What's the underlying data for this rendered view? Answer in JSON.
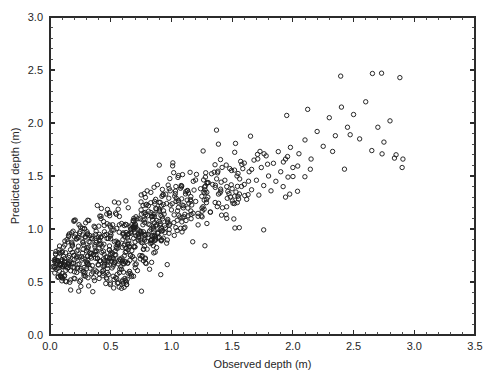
{
  "chart_data": {
    "type": "scatter",
    "title": "",
    "xlabel": "Observed depth (m)",
    "ylabel": "Predicted depth (m)",
    "xlim": [
      0.0,
      3.5
    ],
    "ylim": [
      0.0,
      3.0
    ],
    "xticks": [
      "0.0",
      "0.5",
      "1.0",
      "1.5",
      "2.0",
      "2.5",
      "3.0",
      "3.5"
    ],
    "yticks": [
      "0.0",
      "0.5",
      "1.0",
      "1.5",
      "2.0",
      "2.5",
      "3.0"
    ],
    "xtick_values": [
      0.0,
      0.5,
      1.0,
      1.5,
      2.0,
      2.5,
      3.0,
      3.5
    ],
    "ytick_values": [
      0.0,
      0.5,
      1.0,
      1.5,
      2.0,
      2.5,
      3.0
    ],
    "minor_tick_step": 0.1,
    "grid": false,
    "legend": null,
    "marker": "open-circle",
    "marker_size_px": 4.4,
    "marker_color": "#1c1c1c",
    "background": "#ffffff",
    "frame": "box",
    "tick_direction": "in",
    "n_points": 812,
    "series": [
      {
        "name": "observations",
        "points": [
          [
            0.05,
            0.62
          ],
          [
            0.06,
            0.7
          ],
          [
            0.07,
            0.55
          ],
          [
            0.08,
            0.78
          ],
          [
            0.09,
            0.66
          ],
          [
            0.1,
            0.58
          ],
          [
            0.11,
            0.83
          ],
          [
            0.12,
            0.72
          ],
          [
            0.13,
            0.61
          ],
          [
            0.14,
            0.9
          ],
          [
            0.15,
            0.68
          ],
          [
            0.16,
            0.75
          ],
          [
            0.17,
            0.52
          ],
          [
            0.18,
            0.86
          ],
          [
            0.19,
            0.64
          ],
          [
            0.2,
            0.71
          ],
          [
            0.21,
            0.95
          ],
          [
            0.22,
            0.59
          ],
          [
            0.23,
            0.8
          ],
          [
            0.24,
            0.67
          ],
          [
            0.25,
            1.02
          ],
          [
            0.26,
            0.74
          ],
          [
            0.27,
            0.88
          ],
          [
            0.28,
            0.56
          ],
          [
            0.29,
            0.93
          ],
          [
            0.3,
            0.69
          ],
          [
            0.31,
            0.81
          ],
          [
            0.32,
            1.08
          ],
          [
            0.33,
            0.63
          ],
          [
            0.34,
            0.77
          ],
          [
            0.35,
            0.91
          ],
          [
            0.36,
            0.54
          ],
          [
            0.37,
            0.85
          ],
          [
            0.38,
            0.98
          ],
          [
            0.39,
            0.72
          ],
          [
            0.4,
            0.66
          ],
          [
            0.41,
            0.89
          ],
          [
            0.42,
            1.12
          ],
          [
            0.43,
            0.6
          ],
          [
            0.44,
            0.79
          ],
          [
            0.45,
            0.94
          ],
          [
            0.46,
            0.7
          ],
          [
            0.47,
            1.05
          ],
          [
            0.48,
            0.57
          ],
          [
            0.49,
            0.84
          ],
          [
            0.5,
            0.76
          ],
          [
            0.51,
            0.99
          ],
          [
            0.52,
            0.65
          ],
          [
            0.53,
            0.88
          ],
          [
            0.54,
            1.15
          ],
          [
            0.55,
            0.53
          ],
          [
            0.56,
            0.82
          ],
          [
            0.57,
            0.97
          ],
          [
            0.58,
            0.71
          ],
          [
            0.59,
            0.62
          ],
          [
            0.6,
            0.9
          ],
          [
            0.61,
            0.45
          ],
          [
            0.62,
            0.78
          ],
          [
            0.63,
            1.04
          ],
          [
            0.64,
            0.68
          ],
          [
            0.65,
            0.86
          ],
          [
            0.66,
            0.58
          ],
          [
            0.67,
            0.96
          ],
          [
            0.68,
            0.74
          ],
          [
            0.69,
            1.1
          ],
          [
            0.7,
            0.83
          ],
          [
            0.71,
            0.67
          ],
          [
            0.72,
            1.0
          ],
          [
            0.73,
            0.92
          ],
          [
            0.74,
            0.75
          ],
          [
            0.75,
            1.18
          ],
          [
            0.76,
            0.87
          ],
          [
            0.77,
            0.7
          ],
          [
            0.78,
            1.06
          ],
          [
            0.79,
            0.95
          ],
          [
            0.8,
            0.81
          ],
          [
            0.81,
            1.22
          ],
          [
            0.82,
            0.98
          ],
          [
            0.83,
            0.89
          ],
          [
            0.84,
            1.12
          ],
          [
            0.85,
            1.02
          ],
          [
            0.86,
            0.93
          ],
          [
            0.87,
            1.28
          ],
          [
            0.88,
            1.08
          ],
          [
            0.89,
            0.97
          ],
          [
            0.9,
            1.19
          ],
          [
            0.91,
            1.05
          ],
          [
            0.92,
            0.9
          ],
          [
            0.93,
            1.32
          ],
          [
            0.94,
            1.14
          ],
          [
            0.95,
            1.01
          ],
          [
            0.96,
            1.24
          ],
          [
            0.97,
            1.09
          ],
          [
            0.98,
            0.96
          ],
          [
            0.99,
            1.36
          ],
          [
            1.0,
            1.18
          ],
          [
            1.02,
            1.06
          ],
          [
            1.04,
            1.29
          ],
          [
            1.06,
            1.13
          ],
          [
            1.08,
            1.41
          ],
          [
            1.1,
            1.22
          ],
          [
            1.12,
            1.08
          ],
          [
            1.14,
            1.34
          ],
          [
            1.16,
            1.17
          ],
          [
            1.18,
            1.45
          ],
          [
            1.2,
            1.26
          ],
          [
            1.22,
            1.12
          ],
          [
            1.24,
            1.38
          ],
          [
            1.26,
            1.21
          ],
          [
            1.28,
            1.49
          ],
          [
            1.3,
            1.3
          ],
          [
            1.32,
            1.16
          ],
          [
            1.34,
            1.42
          ],
          [
            1.36,
            1.25
          ],
          [
            1.38,
            1.53
          ],
          [
            1.4,
            1.34
          ],
          [
            1.42,
            1.2
          ],
          [
            1.44,
            1.46
          ],
          [
            1.46,
            1.29
          ],
          [
            1.48,
            1.57
          ],
          [
            1.5,
            1.38
          ],
          [
            1.52,
            1.24
          ],
          [
            1.54,
            1.5
          ],
          [
            1.56,
            1.33
          ],
          [
            1.58,
            1.61
          ],
          [
            1.6,
            1.42
          ],
          [
            1.62,
            1.28
          ],
          [
            1.64,
            1.54
          ],
          [
            1.66,
            1.37
          ],
          [
            1.68,
            1.65
          ],
          [
            1.7,
            1.46
          ],
          [
            1.72,
            1.32
          ],
          [
            1.74,
            1.58
          ],
          [
            1.76,
            1.41
          ],
          [
            1.78,
            1.69
          ],
          [
            1.8,
            1.5
          ],
          [
            1.82,
            1.36
          ],
          [
            1.84,
            1.62
          ],
          [
            1.86,
            1.45
          ],
          [
            1.88,
            1.73
          ],
          [
            1.9,
            1.54
          ],
          [
            1.92,
            1.4
          ],
          [
            1.94,
            1.66
          ],
          [
            1.96,
            1.49
          ],
          [
            1.98,
            1.77
          ],
          [
            2.0,
            1.58
          ],
          [
            2.05,
            1.71
          ],
          [
            2.1,
            1.84
          ],
          [
            2.15,
            1.66
          ],
          [
            2.2,
            1.92
          ],
          [
            2.25,
            1.78
          ],
          [
            2.3,
            2.05
          ],
          [
            2.35,
            1.88
          ],
          [
            2.4,
            2.15
          ],
          [
            2.45,
            1.96
          ],
          [
            2.5,
            2.08
          ],
          [
            2.55,
            1.85
          ],
          [
            2.6,
            2.2
          ],
          [
            2.65,
            1.74
          ],
          [
            2.7,
            1.96
          ],
          [
            2.75,
            1.82
          ],
          [
            2.8,
            2.02
          ],
          [
            2.85,
            1.7
          ],
          [
            2.9,
            1.58
          ]
        ]
      }
    ]
  }
}
